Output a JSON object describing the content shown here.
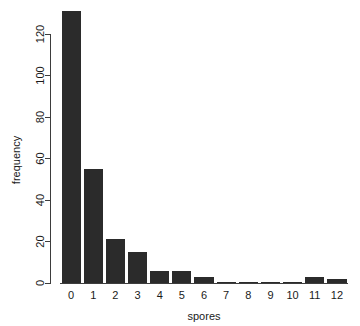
{
  "chart_data": {
    "type": "bar",
    "title": "",
    "subtitle": "",
    "xlabel": "spores",
    "ylabel": "frequency",
    "categories": [
      "0",
      "1",
      "2",
      "3",
      "4",
      "5",
      "6",
      "7",
      "8",
      "9",
      "10",
      "11",
      "12"
    ],
    "values": [
      131,
      55,
      21,
      15,
      6,
      6,
      3,
      0,
      0,
      0,
      0,
      3,
      2
    ],
    "series": [
      {
        "name": "frequency",
        "values": [
          131,
          55,
          21,
          15,
          6,
          6,
          3,
          0,
          0,
          0,
          0,
          3,
          2
        ]
      }
    ],
    "xlim": [
      -0.5,
      12.5
    ],
    "ylim": [
      0,
      131
    ],
    "yticks": [
      0,
      20,
      40,
      60,
      80,
      100,
      120
    ],
    "ytick_labels": [
      "0",
      "20",
      "40",
      "60",
      "80",
      "100",
      "120"
    ],
    "xtick_labels": [
      "0",
      "1",
      "2",
      "3",
      "4",
      "5",
      "6",
      "7",
      "8",
      "9",
      "10",
      "11",
      "12"
    ],
    "grid": false,
    "legend": false,
    "legend_position": "none",
    "bar_color": "#2b2b2b",
    "axis_color": "#3d3d3d",
    "background_color": "#ffffff",
    "text_color": "#1a1a1a"
  }
}
